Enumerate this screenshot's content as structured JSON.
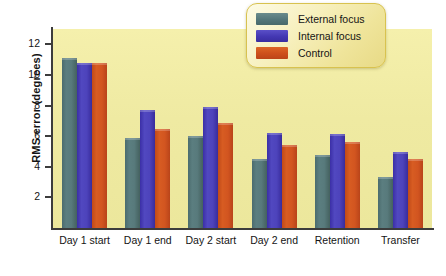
{
  "chart_data": {
    "type": "bar",
    "title": "",
    "xlabel": "",
    "ylabel": "RMS error (degrees)",
    "ylim": [
      0,
      13
    ],
    "yticks": [
      2,
      4,
      6,
      8,
      10,
      12
    ],
    "ytick_labels": [
      "2",
      "4",
      "6",
      "8",
      "10",
      "12"
    ],
    "grid": false,
    "legend_position": "top-right",
    "categories": [
      "Day 1 start",
      "Day 1 end",
      "Day 2 start",
      "Day 2 end",
      "Retention",
      "Transfer"
    ],
    "series": [
      {
        "name": "External focus",
        "color": "#53767a",
        "values": [
          11.1,
          5.9,
          6.0,
          4.5,
          4.75,
          3.35
        ]
      },
      {
        "name": "Internal focus",
        "color": "#4337b2",
        "values": [
          10.75,
          7.7,
          7.9,
          6.2,
          6.15,
          4.95
        ]
      },
      {
        "name": "Control",
        "color": "#cd4f1c",
        "values": [
          10.75,
          6.45,
          6.85,
          5.4,
          5.6,
          4.5
        ]
      }
    ]
  }
}
